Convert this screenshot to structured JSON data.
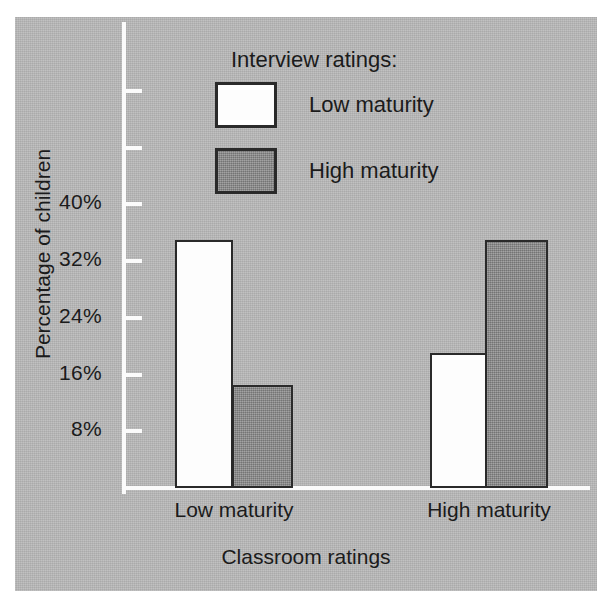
{
  "chart_data": {
    "type": "bar",
    "title": "",
    "xlabel": "Classroom ratings",
    "ylabel": "Percentage of children",
    "categories": [
      "Low maturity",
      "High maturity"
    ],
    "series": [
      {
        "name": "Low maturity",
        "values": [
          35,
          19
        ],
        "color": "#fdfdfd"
      },
      {
        "name": "High maturity",
        "values": [
          14.5,
          35
        ],
        "color": "#8e8e8e"
      }
    ],
    "ylim": [
      0,
      56
    ],
    "ytick_values": [
      8,
      16,
      24,
      32,
      40,
      48,
      56
    ],
    "ytick_labels": [
      "8%",
      "16%",
      "24%",
      "32%",
      "40%",
      "",
      ""
    ],
    "grid": false,
    "legend_position": "inside-top-center",
    "legend_title": "Interview ratings:",
    "background_color": "#b9b9b9",
    "axis_color": "#fbfbfb",
    "text_color": "#1b1b1b"
  },
  "legend": {
    "title": "Interview ratings:",
    "entries": [
      {
        "label": "Low maturity",
        "swatch": "white-square-swatch"
      },
      {
        "label": "High maturity",
        "swatch": "gray-square-swatch"
      }
    ]
  },
  "axes": {
    "y_title": "Percentage of children",
    "x_title": "Classroom ratings",
    "y_ticks": [
      {
        "label": "8%",
        "value": 8
      },
      {
        "label": "16%",
        "value": 16
      },
      {
        "label": "24%",
        "value": 24
      },
      {
        "label": "32%",
        "value": 32
      },
      {
        "label": "40%",
        "value": 40
      },
      {
        "label": "",
        "value": 48
      },
      {
        "label": "",
        "value": 56
      }
    ],
    "x_categories": [
      "Low maturity",
      "High maturity"
    ]
  }
}
